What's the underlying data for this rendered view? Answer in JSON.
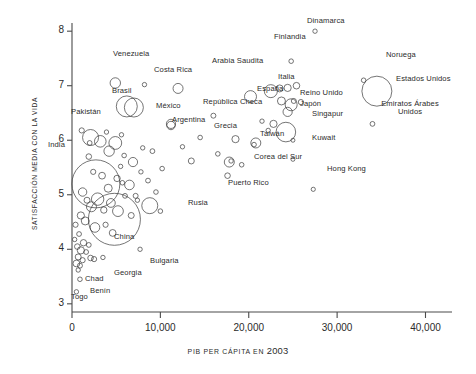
{
  "chart_data": {
    "type": "scatter",
    "title": "",
    "xlabel": "PIB PER CÁPITA EN 2003",
    "xlabel_plain": "PIB PER CÁPITA EN",
    "xlabel_year": "2003",
    "ylabel": "SATISFACCIÓN MEDIA CON LA VIDA",
    "xlim": [
      0,
      43000
    ],
    "ylim": [
      2.85,
      8.15
    ],
    "xticks": [
      0,
      10000,
      20000,
      30000,
      40000
    ],
    "xticklabels": [
      "0",
      "10,000",
      "20,000",
      "30,000",
      "40,000"
    ],
    "yticks": [
      3,
      4,
      5,
      6,
      7,
      8
    ],
    "yticklabels": [
      "3",
      "4",
      "5",
      "6",
      "7",
      "8"
    ],
    "grid": false,
    "legend": false,
    "marker": "open-circle",
    "size_encodes": "population",
    "labeled_points": [
      {
        "name": "Venezuela",
        "x": 4900,
        "y": 7.05,
        "r": 5.2,
        "lx": 113,
        "ly": 50,
        "lines": 1
      },
      {
        "name": "Costa Rica",
        "x": 8200,
        "y": 7.02,
        "r": 2.2,
        "lx": 154,
        "ly": 66,
        "lines": 1
      },
      {
        "name": "Brasil",
        "x": 6200,
        "y": 6.62,
        "r": 10.5,
        "lx": 112,
        "ly": 87,
        "lines": 1
      },
      {
        "name": "México",
        "x": 7000,
        "y": 6.6,
        "r": 9.5,
        "lx": 156,
        "ly": 102,
        "lines": 1
      },
      {
        "name": "Arabia Saudita",
        "x": 12000,
        "y": 6.95,
        "r": 5.0,
        "lx": 212,
        "ly": 57,
        "lines": 1
      },
      {
        "name": "España",
        "x": 20200,
        "y": 6.8,
        "r": 6.0,
        "lx": 257,
        "ly": 85,
        "lines": 1
      },
      {
        "name": "Italia",
        "x": 22500,
        "y": 6.9,
        "r": 6.5,
        "lx": 278,
        "ly": 73,
        "lines": 1
      },
      {
        "name": "Finlandia",
        "x": 24800,
        "y": 7.45,
        "r": 2.3,
        "lx": 274,
        "ly": 33,
        "lines": 1
      },
      {
        "name": "Dinamarca",
        "x": 27500,
        "y": 8.0,
        "r": 2.2,
        "lx": 307,
        "ly": 17,
        "lines": 1
      },
      {
        "name": "Noruega",
        "x": 33000,
        "y": 7.1,
        "r": 2.3,
        "lx": 386,
        "ly": 51,
        "lines": 1
      },
      {
        "name": "Estados Unidos",
        "x": 34500,
        "y": 6.9,
        "r": 15.0,
        "lx": 396,
        "ly": 75,
        "lines": 1
      },
      {
        "name": "Emiratos Árabes\nUnidos",
        "x": 34000,
        "y": 6.3,
        "r": 2.4,
        "lx": 380,
        "ly": 100,
        "lines": 2
      },
      {
        "name": "Reino Unido",
        "x": 24800,
        "y": 6.65,
        "r": 6.0,
        "lx": 300,
        "ly": 89,
        "lines": 1
      },
      {
        "name": "Japón",
        "x": 24200,
        "y": 6.15,
        "r": 9.8,
        "lx": 300,
        "ly": 100,
        "lines": 1
      },
      {
        "name": "Singapur",
        "x": 25000,
        "y": 6.0,
        "r": 2.0,
        "lx": 312,
        "ly": 110,
        "lines": 1
      },
      {
        "name": "Kuwait",
        "x": 25000,
        "y": 5.65,
        "r": 2.0,
        "lx": 312,
        "ly": 134,
        "lines": 1
      },
      {
        "name": "Hong Kong",
        "x": 27300,
        "y": 5.1,
        "r": 2.1,
        "lx": 327,
        "ly": 165,
        "lines": 1
      },
      {
        "name": "República Checa",
        "x": 16000,
        "y": 6.45,
        "r": 2.5,
        "lx": 203,
        "ly": 98,
        "lines": 1
      },
      {
        "name": "Grecia",
        "x": 18500,
        "y": 6.02,
        "r": 3.6,
        "lx": 214,
        "ly": 122,
        "lines": 1
      },
      {
        "name": "Taiwán",
        "x": 20800,
        "y": 5.95,
        "r": 5.0,
        "lx": 260,
        "ly": 130,
        "lines": 1
      },
      {
        "name": "Corea del Sur",
        "x": 17800,
        "y": 5.6,
        "r": 5.0,
        "lx": 254,
        "ly": 153,
        "lines": 1
      },
      {
        "name": "Puerto Rico",
        "x": 17600,
        "y": 5.35,
        "r": 2.8,
        "lx": 228,
        "ly": 179,
        "lines": 1
      },
      {
        "name": "Argentina",
        "x": 11200,
        "y": 6.3,
        "r": 4.6,
        "lx": 172,
        "ly": 116,
        "lines": 1
      },
      {
        "name": "Pakistán",
        "x": 2100,
        "y": 6.05,
        "r": 8.0,
        "lx": 71,
        "ly": 108,
        "lines": 1
      },
      {
        "name": "India",
        "x": 2700,
        "y": 5.2,
        "r": 24.0,
        "lx": 48,
        "ly": 141,
        "lines": 1
      },
      {
        "name": "Rusia",
        "x": 8800,
        "y": 4.8,
        "r": 8.0,
        "lx": 188,
        "ly": 199,
        "lines": 1
      },
      {
        "name": "China",
        "x": 4800,
        "y": 4.55,
        "r": 26.0,
        "lx": 114,
        "ly": 233,
        "lines": 1
      },
      {
        "name": "Bulgaria",
        "x": 7700,
        "y": 4.0,
        "r": 2.2,
        "lx": 150,
        "ly": 257,
        "lines": 1
      },
      {
        "name": "Georgia",
        "x": 3500,
        "y": 3.85,
        "r": 2.2,
        "lx": 114,
        "ly": 269,
        "lines": 1
      },
      {
        "name": "Chad",
        "x": 700,
        "y": 3.62,
        "r": 2.2,
        "lx": 85,
        "ly": 275,
        "lines": 1
      },
      {
        "name": "Benín",
        "x": 900,
        "y": 3.45,
        "r": 2.3,
        "lx": 90,
        "ly": 287,
        "lines": 1
      },
      {
        "name": "Togo",
        "x": 500,
        "y": 3.22,
        "r": 2.2,
        "lx": 71,
        "ly": 293,
        "lines": 1
      }
    ],
    "unlabeled_points": [
      {
        "x": 1100,
        "y": 6.18,
        "r": 2.6
      },
      {
        "x": 2000,
        "y": 5.95,
        "r": 2.4
      },
      {
        "x": 3900,
        "y": 6.15,
        "r": 2.2
      },
      {
        "x": 5600,
        "y": 6.1,
        "r": 2.2
      },
      {
        "x": 1900,
        "y": 5.7,
        "r": 2.8
      },
      {
        "x": 3200,
        "y": 5.98,
        "r": 5.8
      },
      {
        "x": 4200,
        "y": 5.8,
        "r": 5.2
      },
      {
        "x": 4900,
        "y": 5.95,
        "r": 6.4
      },
      {
        "x": 5900,
        "y": 5.72,
        "r": 2.3
      },
      {
        "x": 6900,
        "y": 5.6,
        "r": 4.6
      },
      {
        "x": 8000,
        "y": 5.86,
        "r": 2.2
      },
      {
        "x": 9100,
        "y": 5.8,
        "r": 2.4
      },
      {
        "x": 10200,
        "y": 5.48,
        "r": 2.3
      },
      {
        "x": 11200,
        "y": 6.27,
        "r": 4.2
      },
      {
        "x": 13500,
        "y": 5.62,
        "r": 3.0
      },
      {
        "x": 16500,
        "y": 5.75,
        "r": 2.3
      },
      {
        "x": 19200,
        "y": 5.55,
        "r": 2.3
      },
      {
        "x": 21500,
        "y": 6.35,
        "r": 2.2
      },
      {
        "x": 22800,
        "y": 6.3,
        "r": 3.6
      },
      {
        "x": 23500,
        "y": 6.95,
        "r": 3.5
      },
      {
        "x": 24400,
        "y": 6.96,
        "r": 3.6
      },
      {
        "x": 25400,
        "y": 7.0,
        "r": 3.3
      },
      {
        "x": 23700,
        "y": 6.72,
        "r": 4.0
      },
      {
        "x": 24400,
        "y": 6.52,
        "r": 4.6
      },
      {
        "x": 25100,
        "y": 6.72,
        "r": 2.5
      },
      {
        "x": 25900,
        "y": 6.7,
        "r": 2.6
      },
      {
        "x": 22200,
        "y": 6.18,
        "r": 2.2
      },
      {
        "x": 20600,
        "y": 5.92,
        "r": 2.3
      },
      {
        "x": 18000,
        "y": 5.62,
        "r": 2.2
      },
      {
        "x": 2400,
        "y": 5.42,
        "r": 2.6
      },
      {
        "x": 3400,
        "y": 5.35,
        "r": 3.4
      },
      {
        "x": 4100,
        "y": 5.12,
        "r": 4.0
      },
      {
        "x": 5100,
        "y": 5.3,
        "r": 3.2
      },
      {
        "x": 5700,
        "y": 5.22,
        "r": 2.3
      },
      {
        "x": 6500,
        "y": 5.18,
        "r": 4.8
      },
      {
        "x": 7200,
        "y": 4.98,
        "r": 2.5
      },
      {
        "x": 8600,
        "y": 5.26,
        "r": 2.4
      },
      {
        "x": 9500,
        "y": 5.05,
        "r": 2.3
      },
      {
        "x": 1200,
        "y": 5.05,
        "r": 4.2
      },
      {
        "x": 1700,
        "y": 4.9,
        "r": 3.0
      },
      {
        "x": 2200,
        "y": 4.78,
        "r": 5.0
      },
      {
        "x": 2900,
        "y": 4.92,
        "r": 6.2
      },
      {
        "x": 3600,
        "y": 4.72,
        "r": 3.2
      },
      {
        "x": 4400,
        "y": 4.85,
        "r": 4.4
      },
      {
        "x": 5200,
        "y": 4.7,
        "r": 5.4
      },
      {
        "x": 6000,
        "y": 4.98,
        "r": 2.4
      },
      {
        "x": 6700,
        "y": 4.62,
        "r": 3.0
      },
      {
        "x": 7400,
        "y": 4.9,
        "r": 2.2
      },
      {
        "x": 10000,
        "y": 4.7,
        "r": 2.3
      },
      {
        "x": 1000,
        "y": 4.62,
        "r": 3.6
      },
      {
        "x": 1500,
        "y": 4.52,
        "r": 4.0
      },
      {
        "x": 2600,
        "y": 4.4,
        "r": 4.8
      },
      {
        "x": 3800,
        "y": 4.45,
        "r": 2.6
      },
      {
        "x": 4600,
        "y": 4.3,
        "r": 3.4
      },
      {
        "x": 800,
        "y": 4.28,
        "r": 2.4
      },
      {
        "x": 1300,
        "y": 4.12,
        "r": 3.2
      },
      {
        "x": 600,
        "y": 4.05,
        "r": 2.8
      },
      {
        "x": 1000,
        "y": 3.98,
        "r": 3.6
      },
      {
        "x": 1600,
        "y": 3.95,
        "r": 2.4
      },
      {
        "x": 700,
        "y": 3.86,
        "r": 3.0
      },
      {
        "x": 1200,
        "y": 3.8,
        "r": 2.6
      },
      {
        "x": 2100,
        "y": 3.84,
        "r": 2.8
      },
      {
        "x": 2500,
        "y": 3.82,
        "r": 2.6
      },
      {
        "x": 500,
        "y": 3.74,
        "r": 3.4
      },
      {
        "x": 900,
        "y": 3.7,
        "r": 2.5
      },
      {
        "x": 400,
        "y": 4.45,
        "r": 2.6
      },
      {
        "x": 300,
        "y": 4.18,
        "r": 2.2
      },
      {
        "x": 1900,
        "y": 4.08,
        "r": 2.4
      },
      {
        "x": 5500,
        "y": 5.52,
        "r": 2.2
      },
      {
        "x": 7800,
        "y": 5.42,
        "r": 2.2
      },
      {
        "x": 12500,
        "y": 5.88,
        "r": 2.2
      },
      {
        "x": 14500,
        "y": 6.05,
        "r": 2.3
      }
    ]
  },
  "axis": {
    "y_title": "SATISFACCIÓN MEDIA CON LA VIDA",
    "x_title_plain": "PIB PER CÁPITA EN",
    "x_title_year": "2003"
  }
}
